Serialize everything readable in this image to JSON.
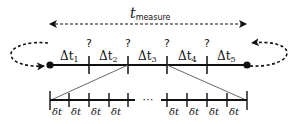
{
  "title": {
    "symbol": "t",
    "subscript": "measure"
  },
  "intervals": [
    {
      "symbol": "Δt",
      "index": "1"
    },
    {
      "symbol": "Δt",
      "index": "2"
    },
    {
      "symbol": "Δt",
      "index": "3"
    },
    {
      "symbol": "Δt",
      "index": "4"
    },
    {
      "symbol": "Δt",
      "index": "5"
    }
  ],
  "boundary_marks": [
    "?",
    "?",
    "?",
    "?"
  ],
  "sub_intervals_left": [
    "δt",
    "δt",
    "δt",
    "δt"
  ],
  "sub_intervals_right": [
    "δt",
    "δt",
    "δt",
    "δt"
  ],
  "ellipsis": "⋯",
  "colors": {
    "stroke": "#111111",
    "thin_stroke": "#555555",
    "background": "#ffffff"
  }
}
